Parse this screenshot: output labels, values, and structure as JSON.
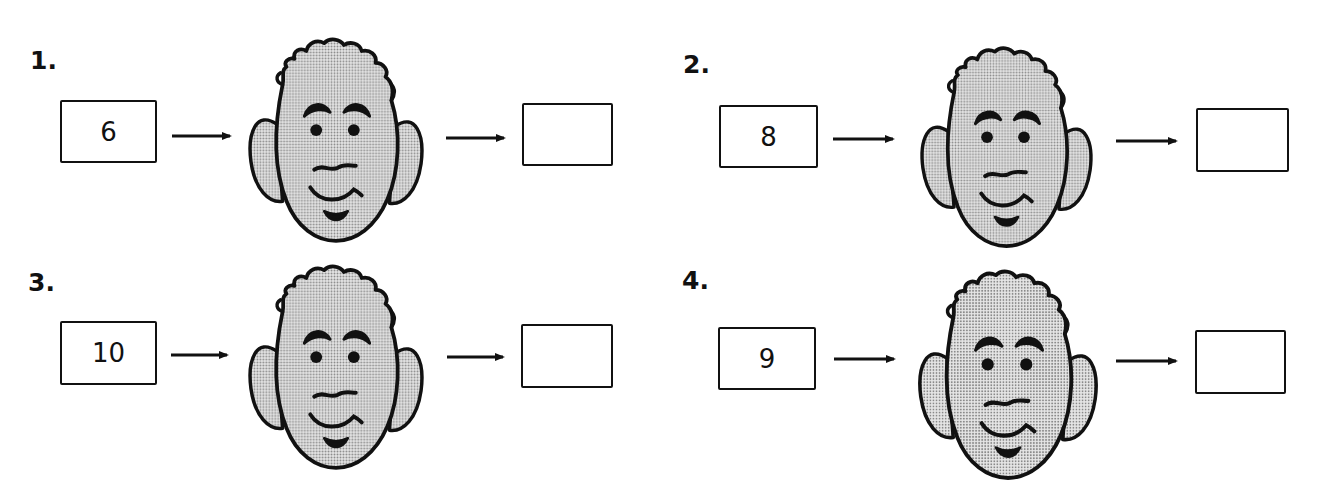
{
  "worksheet": {
    "problems": [
      {
        "label": "1.",
        "input": "6",
        "output": ""
      },
      {
        "label": "2.",
        "input": "8",
        "output": ""
      },
      {
        "label": "3.",
        "input": "10",
        "output": ""
      },
      {
        "label": "4.",
        "input": "9",
        "output": ""
      }
    ],
    "icons": {
      "arrow": "right-arrow-icon",
      "machine": "cartoon-face-function-machine"
    },
    "colors": {
      "ink": "#111111",
      "face_fill": "#c9c9c9",
      "background": "#ffffff"
    }
  }
}
